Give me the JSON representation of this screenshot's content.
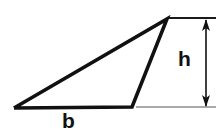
{
  "figure": {
    "kind": "geometry-diagram",
    "background_color": "#ffffff",
    "stroke_color": "#111111",
    "extension_line_color": "#555555",
    "width": 223,
    "height": 132
  },
  "shape": {
    "name": "triangle",
    "stroke_color": "#111111",
    "stroke_width": 3.6,
    "fill": "none",
    "vertices": [
      {
        "name": "left-vertex",
        "x": 14,
        "y": 108
      },
      {
        "name": "apex-vertex",
        "x": 167,
        "y": 19
      },
      {
        "name": "bottom-right-vertex",
        "x": 132,
        "y": 107
      }
    ],
    "points_attr": "14,108 167,19 132,107 14,108"
  },
  "extension_lines": [
    {
      "name": "top-extension-line",
      "x1": 168,
      "y1": 18,
      "x2": 216,
      "y2": 18,
      "stroke_color": "#1a1a1a",
      "stroke_width": 2.2
    },
    {
      "name": "bottom-extension-line",
      "x1": 136,
      "y1": 107,
      "x2": 216,
      "y2": 107,
      "stroke_color": "#555555",
      "stroke_width": 1.2
    }
  ],
  "dimension": {
    "name": "height-dimension",
    "orientation": "vertical",
    "x": 206,
    "y_top": 20,
    "y_bottom": 106,
    "stroke_color": "#111111",
    "stroke_width": 1.6,
    "arrowheads": "both",
    "arrow_length": 11,
    "arrow_half_width": 4
  },
  "labels": {
    "height": {
      "text": "h",
      "meaning": "height",
      "color": "#111111",
      "x": 186,
      "y": 60
    },
    "base": {
      "text": "b",
      "meaning": "base",
      "color": "#111111",
      "x": 70,
      "y": 121
    }
  }
}
